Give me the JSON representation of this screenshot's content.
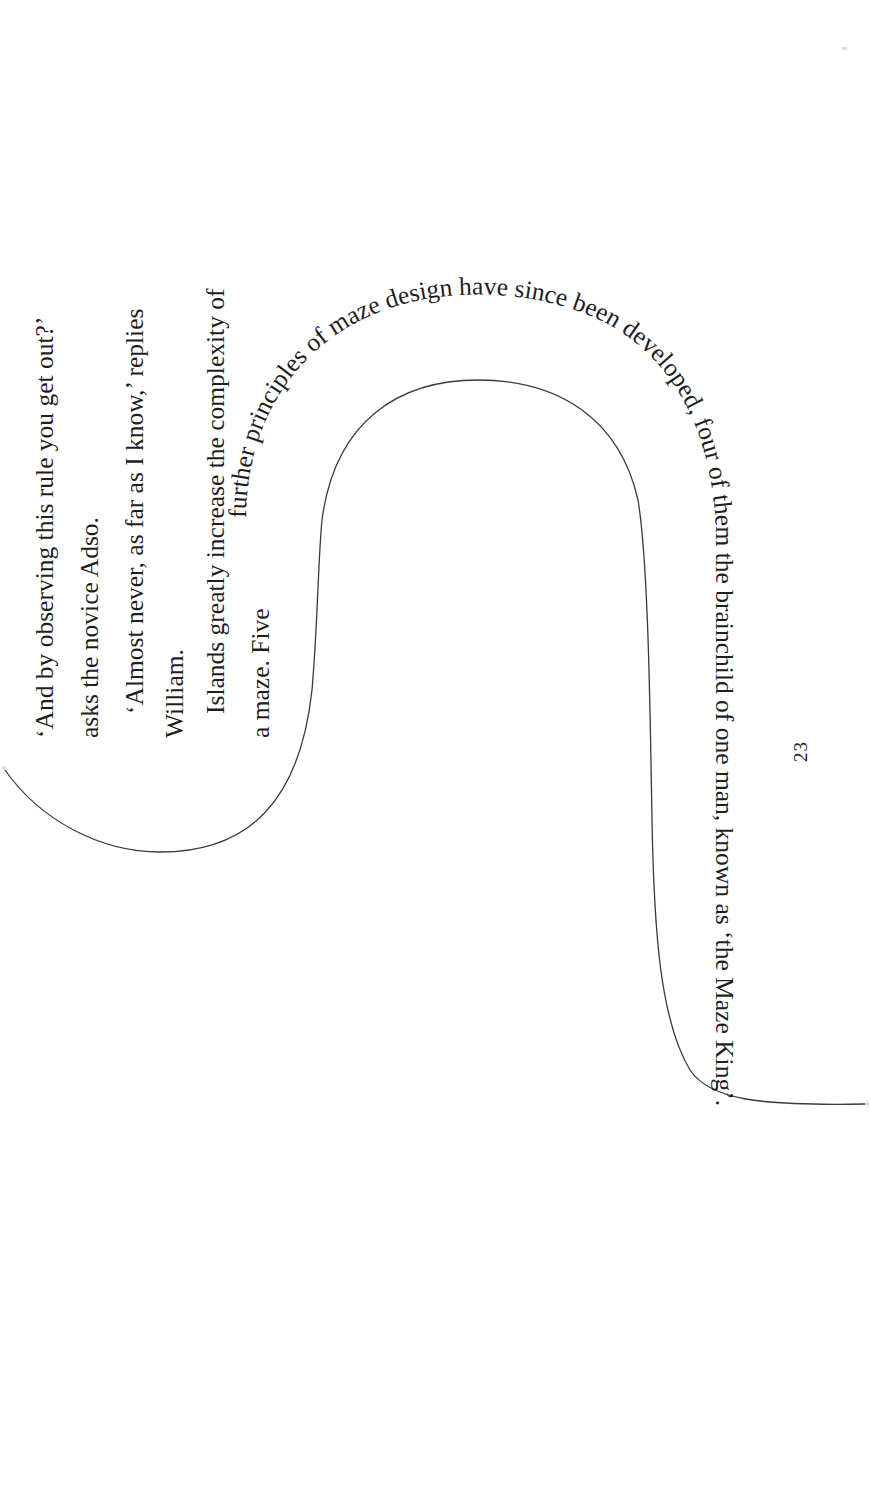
{
  "page": {
    "orientation": "rotated 90 degrees",
    "page_number": "23"
  },
  "paragraphs": {
    "lines": [
      "‘And by observing this rule you get out?’",
      "asks the novice Adso.",
      "‘Almost never, as far as I know,’ replies",
      "William.",
      "Islands greatly increase the complexity of",
      "a maze. Five"
    ]
  },
  "curved_text": {
    "text": "further principles of maze design have since been developed, four of them the brainchild of one man, known as ‘the Maze King’."
  },
  "colors": {
    "text": "#1e1e1e",
    "line": "#3a3a3a",
    "background": "#ffffff"
  }
}
